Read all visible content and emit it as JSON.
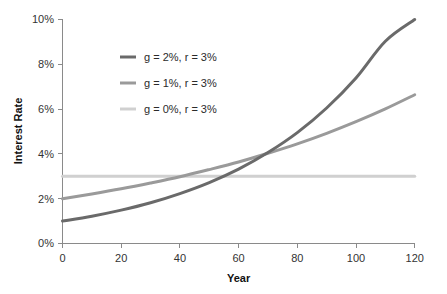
{
  "chart_data": {
    "type": "line",
    "title": "",
    "xlabel": "Year",
    "ylabel": "Interest Rate",
    "xlim": [
      0,
      120
    ],
    "ylim": [
      0,
      10
    ],
    "grid": false,
    "legend_position": "upper-left-inside",
    "x_tick_labels": [
      "0",
      "20",
      "40",
      "60",
      "80",
      "100",
      "120"
    ],
    "x_ticks": [
      0,
      20,
      40,
      60,
      80,
      100,
      120
    ],
    "y_tick_labels": [
      "0%",
      "2%",
      "4%",
      "6%",
      "8%",
      "10%"
    ],
    "y_ticks": [
      0,
      2,
      4,
      6,
      8,
      10
    ],
    "x": [
      0,
      10,
      20,
      30,
      40,
      50,
      60,
      70,
      80,
      90,
      100,
      110,
      120
    ],
    "series": [
      {
        "name": "g = 2%, r = 3%",
        "color": "#6a6a6a",
        "width": 3,
        "values": [
          1.0,
          1.22,
          1.49,
          1.82,
          2.23,
          2.72,
          3.32,
          4.06,
          4.95,
          6.05,
          7.39,
          9.03,
          10.0
        ]
      },
      {
        "name": "g = 1%, r = 3%",
        "color": "#9a9a9a",
        "width": 3,
        "values": [
          2.0,
          2.21,
          2.44,
          2.7,
          2.98,
          3.3,
          3.64,
          4.03,
          4.45,
          4.92,
          5.44,
          6.01,
          6.64
        ]
      },
      {
        "name": "g = 0%, r = 3%",
        "color": "#d0d0d0",
        "width": 3,
        "values": [
          3.0,
          3.0,
          3.0,
          3.0,
          3.0,
          3.0,
          3.0,
          3.0,
          3.0,
          3.0,
          3.0,
          3.0,
          3.0
        ]
      }
    ]
  },
  "axes": {
    "y_title": "Interest Rate",
    "x_title": "Year",
    "y_labels": [
      "10%",
      "8%",
      "6%",
      "4%",
      "2%",
      "0%"
    ],
    "x_labels": [
      "0",
      "20",
      "40",
      "60",
      "80",
      "100",
      "120"
    ]
  },
  "legend": {
    "entries": [
      {
        "label": "g = 2%, r = 3%",
        "color": "#6a6a6a"
      },
      {
        "label": "g = 1%, r = 3%",
        "color": "#9a9a9a"
      },
      {
        "label": "g = 0%, r = 3%",
        "color": "#d0d0d0"
      }
    ]
  },
  "colors": {
    "axis": "#8a8a8a",
    "text": "#2b2b2b",
    "background": "#ffffff"
  }
}
